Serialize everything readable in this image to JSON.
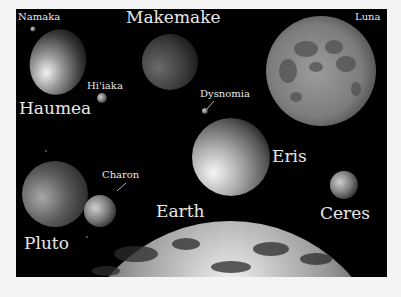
{
  "figure": {
    "background": "#000000",
    "page_background": "#f4f4f4",
    "label_color": "#e8e8e8"
  },
  "bodies": [
    {
      "id": "namaka",
      "label": "Namaka"
    },
    {
      "id": "haumea",
      "label": "Haumea"
    },
    {
      "id": "hiiaka",
      "label": "Hi'iaka"
    },
    {
      "id": "makemake",
      "label": "Makemake"
    },
    {
      "id": "luna",
      "label": "Luna"
    },
    {
      "id": "dysnomia",
      "label": "Dysnomia"
    },
    {
      "id": "eris",
      "label": "Eris"
    },
    {
      "id": "pluto",
      "label": "Pluto"
    },
    {
      "id": "charon",
      "label": "Charon"
    },
    {
      "id": "earth",
      "label": "Earth"
    },
    {
      "id": "ceres",
      "label": "Ceres"
    }
  ]
}
